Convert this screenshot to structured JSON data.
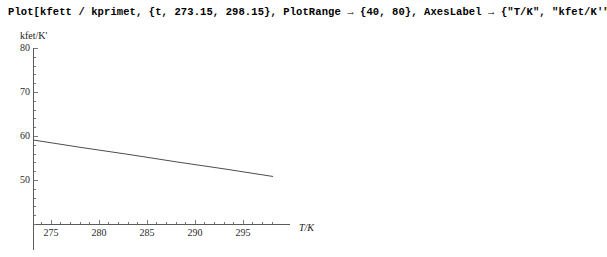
{
  "notebook": {
    "input_line": "Plot[kfett / kprimet, {t, 273.15, 298.15}, PlotRange → {40, 80}, AxesLabel → {\"T/K\", \"kfet/K'\"}]"
  },
  "chart_data": {
    "type": "line",
    "title": "",
    "xlabel": "T/K",
    "ylabel": "kfet/K'",
    "xlim": [
      273.15,
      298.15
    ],
    "ylim": [
      40,
      80
    ],
    "grid": false,
    "legend": null,
    "axis_origin": [
      273.15,
      40
    ],
    "x_ticks": [
      275,
      280,
      285,
      290,
      295
    ],
    "x_tick_labels": [
      "275",
      "280",
      "285",
      "290",
      "295"
    ],
    "y_ticks": [
      50,
      60,
      70,
      80
    ],
    "y_tick_labels": [
      "50",
      "60",
      "70",
      "80"
    ],
    "x_minor_step": 1,
    "y_minor_step": 2,
    "series": [
      {
        "name": "kfett / kprimet",
        "x": [
          273.15,
          278.15,
          283.15,
          288.15,
          293.15,
          298.15
        ],
        "y": [
          59.1,
          57.4,
          55.8,
          54.1,
          52.5,
          50.8
        ],
        "color": "#4d4d4d"
      }
    ],
    "colors": {
      "axis": "#5a5a5a",
      "tick": "#7a7a7a",
      "curve": "#4d4d4d",
      "text": "#1a1a1a",
      "background": "#ffffff"
    }
  }
}
